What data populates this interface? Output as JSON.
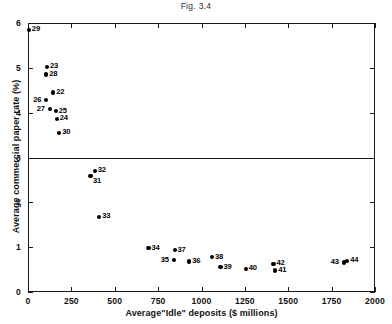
{
  "figure": {
    "title": "Fig. 3.4"
  },
  "chart_data": {
    "type": "scatter",
    "title": "Fig. 3.4",
    "xlabel": "Average\"Idle\" deposits ($ millions)",
    "ylabel": "Average commercial paper rate (%)",
    "xlim": [
      0,
      2000
    ],
    "ylim": [
      0,
      6
    ],
    "xticks": [
      0,
      250,
      500,
      750,
      1000,
      1250,
      1500,
      1750,
      2000
    ],
    "xticklabels": [
      "0",
      "250",
      "500",
      "750",
      "1000",
      "1250",
      "1500",
      "1750",
      "2000"
    ],
    "yticks": [
      0,
      1,
      2,
      3,
      4,
      5,
      6
    ],
    "yticklabels": [
      "0",
      "1",
      "2",
      "3",
      "4",
      "5",
      "6"
    ],
    "grid": false,
    "legend": null,
    "annotations": [
      {
        "type": "hline",
        "y": 3.0,
        "label": "reference line at 3%"
      }
    ],
    "marker": "filled-circle",
    "marker_color": "#000000",
    "points": [
      {
        "label": "29",
        "x": 5,
        "y": 5.85,
        "label_pos": "right"
      },
      {
        "label": "23",
        "x": 110,
        "y": 5.02,
        "label_pos": "right"
      },
      {
        "label": "28",
        "x": 105,
        "y": 4.85,
        "label_pos": "right"
      },
      {
        "label": "22",
        "x": 145,
        "y": 4.45,
        "label_pos": "right"
      },
      {
        "label": "26",
        "x": 105,
        "y": 4.29,
        "label_pos": "left"
      },
      {
        "label": "27",
        "x": 125,
        "y": 4.08,
        "label_pos": "left"
      },
      {
        "label": "25",
        "x": 160,
        "y": 4.03,
        "label_pos": "right"
      },
      {
        "label": "24",
        "x": 165,
        "y": 3.86,
        "label_pos": "right"
      },
      {
        "label": "30",
        "x": 180,
        "y": 3.55,
        "label_pos": "right"
      },
      {
        "label": "32",
        "x": 385,
        "y": 2.7,
        "label_pos": "right"
      },
      {
        "label": "31",
        "x": 360,
        "y": 2.58,
        "label_pos": "below-right"
      },
      {
        "label": "33",
        "x": 410,
        "y": 1.68,
        "label_pos": "right"
      },
      {
        "label": "34",
        "x": 695,
        "y": 0.98,
        "label_pos": "right"
      },
      {
        "label": "37",
        "x": 845,
        "y": 0.93,
        "label_pos": "right"
      },
      {
        "label": "35",
        "x": 840,
        "y": 0.71,
        "label_pos": "left"
      },
      {
        "label": "36",
        "x": 930,
        "y": 0.68,
        "label_pos": "right"
      },
      {
        "label": "38",
        "x": 1060,
        "y": 0.78,
        "label_pos": "right"
      },
      {
        "label": "39",
        "x": 1110,
        "y": 0.55,
        "label_pos": "right"
      },
      {
        "label": "40",
        "x": 1255,
        "y": 0.52,
        "label_pos": "right"
      },
      {
        "label": "42",
        "x": 1415,
        "y": 0.63,
        "label_pos": "right"
      },
      {
        "label": "41",
        "x": 1425,
        "y": 0.48,
        "label_pos": "right"
      },
      {
        "label": "43",
        "x": 1820,
        "y": 0.66,
        "label_pos": "left"
      },
      {
        "label": "44",
        "x": 1840,
        "y": 0.7,
        "label_pos": "right"
      }
    ]
  }
}
